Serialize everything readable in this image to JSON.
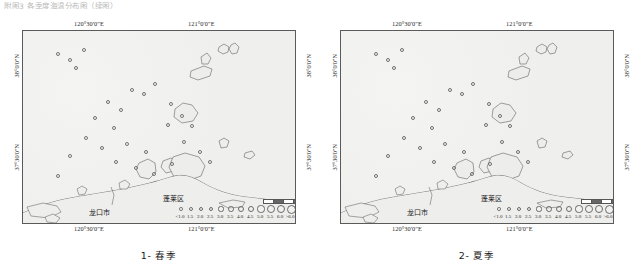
{
  "top_caption": "附图3  各季度海温分布图（续图）",
  "axes": {
    "lon_left": "120°30'0\"E",
    "lon_right": "121°0'0\"E",
    "lat_top": "38°0'0\"N",
    "lat_bottom": "37°30'0\"N"
  },
  "places": [
    {
      "name": "龙口市",
      "x": 66,
      "y": 178
    },
    {
      "name": "蓬莱区",
      "x": 140,
      "y": 165
    }
  ],
  "legend": {
    "labels": [
      "<1.0",
      "1.5",
      "2.0",
      "2.5",
      "3.0",
      "3.5",
      "4.0",
      "4.5",
      "5.0",
      "5.5",
      "6.0",
      ">6.0"
    ],
    "sizes": [
      1.6,
      1.9,
      2.3,
      2.7,
      3.1,
      3.6,
      4.1,
      4.6,
      5.2,
      5.8,
      6.4,
      7.0
    ]
  },
  "panels": [
    {
      "index": "1",
      "caption": "1- 春季",
      "label_number": "1",
      "season": "春季"
    },
    {
      "index": "2",
      "caption": "2- 夏季",
      "label_number": "2",
      "season": "夏季"
    }
  ],
  "chart_data": {
    "type": "scatter",
    "title": "海温分布图",
    "xlabel": "经度",
    "ylabel": "纬度",
    "xlim": [
      120.25,
      121.25
    ],
    "ylim": [
      37.4,
      38.15
    ],
    "legend_position": "bottom-right",
    "grid": false,
    "series": [
      {
        "name": "1- 春季",
        "points": [
          {
            "x": 34,
            "y": 22,
            "v": 1.5
          },
          {
            "x": 46,
            "y": 28,
            "v": 1.5
          },
          {
            "x": 52,
            "y": 36,
            "v": 2.0
          },
          {
            "x": 60,
            "y": 18,
            "v": 1.5
          },
          {
            "x": 84,
            "y": 70,
            "v": 2.0
          },
          {
            "x": 97,
            "y": 78,
            "v": 1.5
          },
          {
            "x": 71,
            "y": 86,
            "v": 2.0
          },
          {
            "x": 90,
            "y": 96,
            "v": 1.5
          },
          {
            "x": 108,
            "y": 58,
            "v": 1.5
          },
          {
            "x": 120,
            "y": 62,
            "v": 2.0
          },
          {
            "x": 131,
            "y": 52,
            "v": 1.5
          },
          {
            "x": 147,
            "y": 72,
            "v": 1.5
          },
          {
            "x": 144,
            "y": 93,
            "v": 2.0
          },
          {
            "x": 158,
            "y": 84,
            "v": 1.5
          },
          {
            "x": 168,
            "y": 94,
            "v": 1.5
          },
          {
            "x": 62,
            "y": 106,
            "v": 1.5
          },
          {
            "x": 78,
            "y": 116,
            "v": 2.0
          },
          {
            "x": 46,
            "y": 124,
            "v": 1.5
          },
          {
            "x": 103,
            "y": 112,
            "v": 1.5
          },
          {
            "x": 122,
            "y": 120,
            "v": 2.0
          },
          {
            "x": 160,
            "y": 110,
            "v": 1.5
          },
          {
            "x": 176,
            "y": 120,
            "v": 1.5
          },
          {
            "x": 92,
            "y": 130,
            "v": 2.0
          },
          {
            "x": 112,
            "y": 136,
            "v": 1.5
          },
          {
            "x": 130,
            "y": 142,
            "v": 1.5
          },
          {
            "x": 148,
            "y": 132,
            "v": 2.0
          },
          {
            "x": 34,
            "y": 144,
            "v": 1.5
          },
          {
            "x": 186,
            "y": 130,
            "v": 1.5
          }
        ]
      },
      {
        "name": "2- 夏季",
        "points": [
          {
            "x": 34,
            "y": 22,
            "v": 2.0
          },
          {
            "x": 46,
            "y": 28,
            "v": 2.0
          },
          {
            "x": 52,
            "y": 36,
            "v": 2.5
          },
          {
            "x": 60,
            "y": 18,
            "v": 2.0
          },
          {
            "x": 84,
            "y": 70,
            "v": 2.5
          },
          {
            "x": 97,
            "y": 78,
            "v": 2.0
          },
          {
            "x": 71,
            "y": 86,
            "v": 2.5
          },
          {
            "x": 90,
            "y": 96,
            "v": 2.0
          },
          {
            "x": 108,
            "y": 58,
            "v": 2.0
          },
          {
            "x": 120,
            "y": 62,
            "v": 2.5
          },
          {
            "x": 131,
            "y": 52,
            "v": 2.0
          },
          {
            "x": 147,
            "y": 72,
            "v": 2.0
          },
          {
            "x": 144,
            "y": 93,
            "v": 2.5
          },
          {
            "x": 158,
            "y": 84,
            "v": 2.0
          },
          {
            "x": 168,
            "y": 94,
            "v": 2.0
          },
          {
            "x": 62,
            "y": 106,
            "v": 2.0
          },
          {
            "x": 78,
            "y": 116,
            "v": 2.5
          },
          {
            "x": 46,
            "y": 124,
            "v": 2.0
          },
          {
            "x": 103,
            "y": 112,
            "v": 2.0
          },
          {
            "x": 122,
            "y": 120,
            "v": 2.5
          },
          {
            "x": 160,
            "y": 110,
            "v": 2.0
          },
          {
            "x": 176,
            "y": 120,
            "v": 2.0
          },
          {
            "x": 92,
            "y": 130,
            "v": 2.5
          },
          {
            "x": 112,
            "y": 136,
            "v": 2.0
          },
          {
            "x": 130,
            "y": 142,
            "v": 2.0
          },
          {
            "x": 148,
            "y": 132,
            "v": 2.5
          },
          {
            "x": 34,
            "y": 144,
            "v": 2.0
          },
          {
            "x": 186,
            "y": 130,
            "v": 2.0
          }
        ]
      }
    ]
  }
}
